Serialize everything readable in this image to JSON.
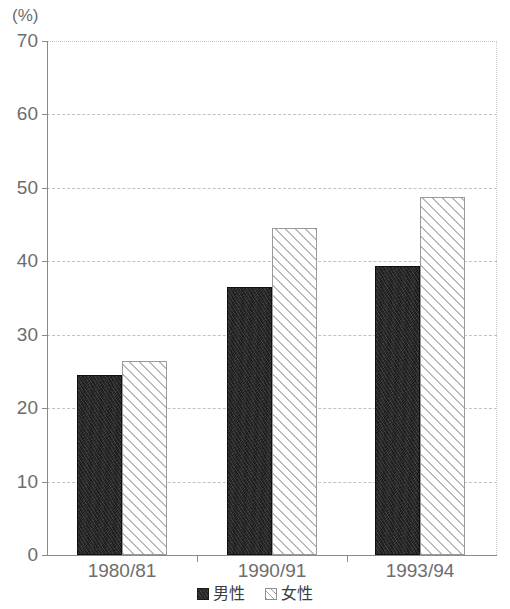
{
  "chart_data": {
    "type": "bar",
    "title": "",
    "subtitle": "",
    "xlabel": "",
    "ylabel": "",
    "unit_label": "(%)",
    "categories": [
      "1980/81",
      "1990/91",
      "1993/94"
    ],
    "series": [
      {
        "name": "男性",
        "values": [
          24.5,
          36.5,
          39.4
        ],
        "style": "solid-dark"
      },
      {
        "name": "女性",
        "values": [
          26.4,
          44.5,
          48.8
        ],
        "style": "diagonal-hatch"
      }
    ],
    "ylim": [
      0,
      70
    ],
    "yticks": [
      0,
      10,
      20,
      30,
      40,
      50,
      60,
      70
    ],
    "ytick_labels": [
      "0",
      "10",
      "20",
      "30",
      "40",
      "50",
      "60",
      "70"
    ],
    "grid": true,
    "grid_style": "dashed",
    "legend_position": "bottom-center",
    "legend_entries": [
      "男性",
      "女性"
    ],
    "colors": {
      "male_fill": "#1c1c1c",
      "female_fill": "#ffffff",
      "female_hatch": "#b9b9b9",
      "gridline": "#c2c2c2",
      "axis": "#8a8a8a",
      "text": "#6d6d6d"
    }
  }
}
